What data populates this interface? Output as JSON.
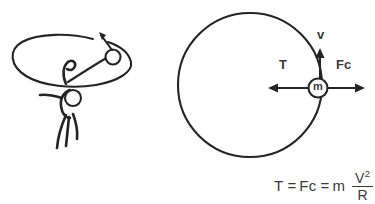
{
  "figure": {
    "panels": {
      "left": {
        "name": "person-swinging-ball",
        "description": "Stick figure swinging a ball on a string around a horizontal elliptical path",
        "elements": [
          "orbit-ellipse",
          "string",
          "ball",
          "direction-arrow",
          "stick-figure"
        ]
      },
      "right": {
        "name": "force-diagram",
        "description": "Circular path with mass m on the rim showing velocity and force vectors",
        "elements": [
          "orbit-circle",
          "mass-marker",
          "velocity-arrow",
          "tension-arrow",
          "centrifugal-arrow"
        ]
      }
    }
  },
  "labels": {
    "velocity": "v",
    "tension": "T",
    "centrifugal": "Fc",
    "mass": "m"
  },
  "equation": {
    "lhs": "T",
    "equals_1": "=",
    "middle": "Fc",
    "equals_2": "=",
    "mass": "m",
    "numerator": "V",
    "numerator_exponent": "2",
    "denominator": "R",
    "plain_text": "T = Fc = m V² / R"
  },
  "colors": {
    "ink": "#242424",
    "text": "#3a3a3a",
    "background": "#ffffff"
  }
}
